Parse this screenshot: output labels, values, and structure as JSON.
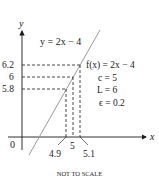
{
  "axes": {
    "x_label": "x",
    "y_label": "y",
    "origin_label": "0"
  },
  "line": {
    "label": "y = 2x − 4",
    "color": "#9a9a9a"
  },
  "y_ticks": [
    {
      "label": "6.2",
      "value": 6.2
    },
    {
      "label": "6",
      "value": 6
    },
    {
      "label": "5.8",
      "value": 5.8
    }
  ],
  "x_ticks": [
    {
      "label": "4.9",
      "value": 4.9
    },
    {
      "label": "5",
      "value": 5
    },
    {
      "label": "5.1",
      "value": 5.1
    }
  ],
  "annotations": {
    "f": "f(x) = 2x − 4",
    "c": "c = 5",
    "L": "L = 6",
    "eps": "ϵ = 0.2"
  },
  "footer": "NOT TO SCALE"
}
